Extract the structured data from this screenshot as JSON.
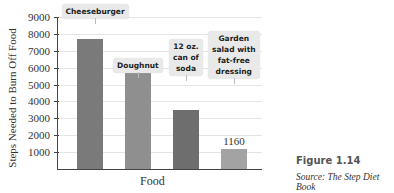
{
  "chart_data": {
    "type": "bar",
    "title": "",
    "xlabel": "Food",
    "ylabel": "Steps Needed to Burn Off Food",
    "ylim": [
      0,
      9000
    ],
    "yticks": [
      1000,
      2000,
      3000,
      4000,
      5000,
      6000,
      7000,
      8000,
      9000
    ],
    "grid": true,
    "categories": [
      "Cheeseburger",
      "Doughnut",
      "12 oz. can of soda",
      "Garden salad with fat-free dressing"
    ],
    "values": [
      7700,
      5800,
      3500,
      1160
    ],
    "bar_colors": [
      "#7a7a7a",
      "#8f8f8f",
      "#6e6e6e",
      "#a3a3a3"
    ],
    "annotations": [
      {
        "category": "Garden salad with fat-free dressing",
        "text": "1160"
      }
    ]
  },
  "labels": {
    "ylabel": "Steps Needed to Burn Off Food",
    "xlabel": "Food",
    "ticks": [
      "9000",
      "8000",
      "7000",
      "6000",
      "5000",
      "4000",
      "3000",
      "2000",
      "1000"
    ],
    "callouts": [
      "Cheeseburger",
      "Doughnut",
      "12 oz.\ncan of\nsoda",
      "Garden\nsalad with\nfat-free\ndressing"
    ],
    "salad_value": "1160"
  },
  "caption": {
    "figure": "Figure 1.14",
    "source": "Source: The Step Diet Book"
  }
}
